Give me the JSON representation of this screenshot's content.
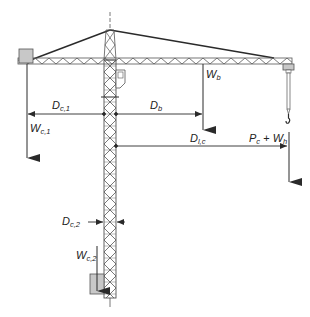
{
  "diagram": {
    "colors": {
      "line": "#2a2a2a",
      "structure": "#555555",
      "counterweight_fill": "#c8c8c8",
      "background": "#ffffff"
    },
    "labels": {
      "dc1": {
        "main": "D",
        "sub": "c,1"
      },
      "db": {
        "main": "D",
        "sub": "b"
      },
      "wb": {
        "main": "W",
        "sub": "b"
      },
      "wc1": {
        "main": "W",
        "sub": "c,1"
      },
      "dlc": {
        "main": "D",
        "sub": "l,c"
      },
      "pc": {
        "main": "P",
        "sub": "c"
      },
      "plus": "+",
      "wh": {
        "main": "W",
        "sub": "h"
      },
      "dc2": {
        "main": "D",
        "sub": "c,2"
      },
      "wc2": {
        "main": "W",
        "sub": "c,2"
      }
    },
    "components": [
      "mast",
      "jib",
      "counter-jib counterweight",
      "tie lines",
      "operator cab",
      "trolley",
      "hook",
      "base counterweight"
    ]
  }
}
